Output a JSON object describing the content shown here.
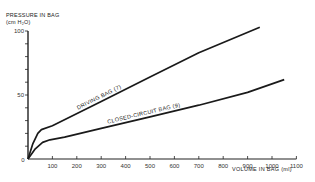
{
  "chart_data": {
    "type": "line",
    "title": "",
    "ylabel_line1": "PRESSURE IN BAG",
    "ylabel_line2": "(cm H₂O)",
    "xlabel": "VOLUME IN BAG  (ml)",
    "xlim": [
      0,
      1100
    ],
    "ylim": [
      0,
      100
    ],
    "x_ticks": [
      0,
      100,
      200,
      300,
      400,
      500,
      600,
      700,
      800,
      900,
      1000,
      1100
    ],
    "x_tick_labels": [
      "0",
      "100",
      "200",
      "300",
      "400",
      "500",
      "600",
      "700",
      "800",
      "900",
      "1000",
      "1100"
    ],
    "y_ticks": [
      0,
      10,
      20,
      30,
      40,
      50,
      60,
      70,
      80,
      90,
      100
    ],
    "y_tick_labels": {
      "0": "0",
      "50": "50",
      "100": "100"
    },
    "grid": false,
    "legend": "inline labels on lines",
    "series": [
      {
        "name": "DRIVING BAG (7)",
        "x": [
          0,
          20,
          40,
          55,
          100,
          300,
          500,
          700,
          950
        ],
        "y": [
          0,
          12,
          20,
          23,
          26,
          45,
          64,
          83,
          103
        ]
      },
      {
        "name": "CLOSED-CIRCUIT BAG (9)",
        "x": [
          0,
          30,
          60,
          90,
          150,
          300,
          500,
          700,
          900,
          1050
        ],
        "y": [
          0,
          8,
          13,
          15,
          17,
          24,
          33,
          42,
          52,
          62
        ]
      }
    ]
  }
}
